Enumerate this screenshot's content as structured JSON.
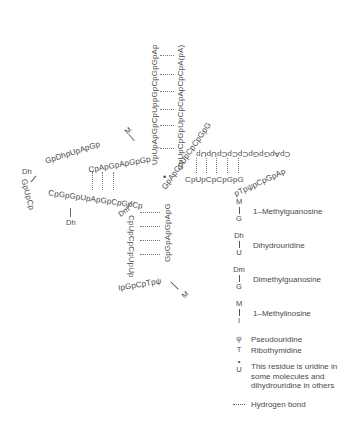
{
  "diagram": {
    "acceptor_stem": {
      "five_prime_strand": "pGpCpGpGpAp",
      "five_prime_full": "pGpCpGpGpApUpUpApGpCpUpCpApGpUpUpGpGpGp",
      "three_prime_strand": "CpUpCpGpUpCpCpApCpCpA(pA)",
      "pairs": 7
    },
    "d_arm": {
      "stem_top": "GpCpUpCp",
      "loop": "ApGpUpUpGpGpDhpDhpApGp",
      "stem_bottom": "UpCpGpGpGpUpApGpCpGp",
      "top_label": "CpUpCpGpGpApGpApGpCp",
      "bottom_label": "CpGpGpUpApGpCpGpCp",
      "modifications": [
        "Dh",
        "Dh",
        "M"
      ]
    },
    "anticodon_arm": {
      "left_strand": "GpCpUpCpCpUpUp",
      "right_strand": "GpApGpApGpG",
      "loop": "IpGpCpTpψp",
      "modifications": [
        "Dm",
        "M"
      ]
    },
    "t_arm": {
      "strand_5": "CpUpCpCpGpGp",
      "strand_3": "ApGpGpCpCpC",
      "loop": "TpψpCpGpApUpUpC",
      "modifications": [
        "T",
        "ψ"
      ]
    },
    "variable_marker": "•"
  },
  "legend": {
    "items": [
      {
        "symbol_top": "M",
        "symbol_bottom": "G",
        "label": "1–Methylguanosine"
      },
      {
        "symbol_top": "Dh",
        "symbol_bottom": "U",
        "label": "Dihydrouridine"
      },
      {
        "symbol_top": "Dm",
        "symbol_bottom": "G",
        "label": "Dimethylguanosine"
      },
      {
        "symbol_top": "M",
        "symbol_bottom": "I",
        "label": "1–Methylinosine"
      }
    ],
    "psi": {
      "symbol": "ψ",
      "label": "Pseudouridine"
    },
    "thymidine": {
      "symbol": "T",
      "label": "Ribothymidine"
    },
    "variable": {
      "symbol": "U",
      "dot": "•",
      "label": "This residue is uridine in some molecules and dihydrouridine in others"
    },
    "hbond": {
      "symbol": "····",
      "label": "Hydrogen bond"
    }
  },
  "labels": {
    "acc_left": "pGpCpGpGpAp",
    "acc_left2": "UpUpApGpCpUp",
    "acc_right": "CpUpCpGpUpCpCpApCpCpA(pA)",
    "d_top": "CpApGpApGpGp",
    "d_loop_top": "GpDhpUpApGp",
    "d_loop_left": "GpUpCp",
    "d_bottom": "CpGpGpUpApGpCpGpCp",
    "d_dh_left": "Dh",
    "d_dh_bottom": "Dh",
    "m_top": "M",
    "dm_label": "Dm",
    "m_bottom": "M",
    "junction": "GpApCpUpCpCpGpG",
    "t_top": "CpApGpGpCpCpCpUpUp",
    "t_loop": "pTpψpCpGpAp",
    "t_bottom_row": "CpUpCpCpGpG",
    "ac_left": "CpUpCpCpUpUp",
    "ac_right": "GpGpApGpApG",
    "ac_loop": "IpGpCpTpψ",
    "dot": "•"
  }
}
